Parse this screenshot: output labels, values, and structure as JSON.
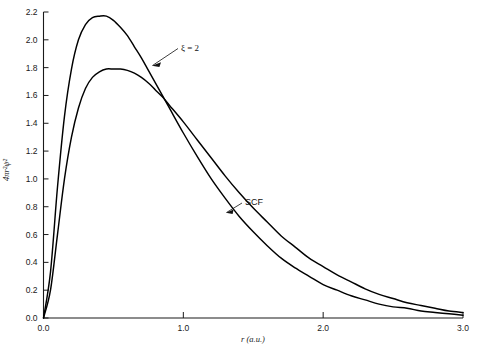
{
  "chart_data": {
    "type": "line",
    "title": "",
    "xlabel": "r (a.u.)",
    "ylabel": "4πr²ψ²",
    "xlim": [
      0.0,
      3.0
    ],
    "ylim": [
      0.0,
      2.2
    ],
    "grid": false,
    "legend_position": "inline-annotations",
    "xticks": [
      "0.0",
      "1.0",
      "2.0",
      "3.0"
    ],
    "xtick_values": [
      0.0,
      1.0,
      2.0,
      3.0
    ],
    "yticks": [
      "0.0",
      "0.2",
      "0.4",
      "0.6",
      "0.8",
      "1.0",
      "1.2",
      "1.4",
      "1.6",
      "1.8",
      "2.0",
      "2.2"
    ],
    "ytick_values": [
      0.0,
      0.2,
      0.4,
      0.6,
      0.8,
      1.0,
      1.2,
      1.4,
      1.6,
      1.8,
      2.0,
      2.2
    ],
    "series": [
      {
        "name": "ξ = 2",
        "color": "#000000",
        "peak_x": 0.47,
        "peak_y": 2.17,
        "x": [
          0.0,
          0.05,
          0.1,
          0.15,
          0.2,
          0.25,
          0.3,
          0.35,
          0.4,
          0.45,
          0.5,
          0.55,
          0.6,
          0.65,
          0.7,
          0.75,
          0.8,
          0.85,
          0.9,
          1.0,
          1.1,
          1.2,
          1.3,
          1.4,
          1.5,
          1.6,
          1.7,
          1.8,
          1.9,
          2.0,
          2.1,
          2.2,
          2.3,
          2.4,
          2.5,
          2.6,
          2.7,
          2.8,
          2.9,
          3.0
        ],
        "y": [
          0.0,
          0.33,
          0.94,
          1.45,
          1.79,
          2.0,
          2.11,
          2.16,
          2.17,
          2.17,
          2.14,
          2.09,
          2.03,
          1.95,
          1.87,
          1.78,
          1.69,
          1.6,
          1.51,
          1.33,
          1.16,
          1.0,
          0.86,
          0.73,
          0.62,
          0.52,
          0.43,
          0.36,
          0.3,
          0.24,
          0.2,
          0.16,
          0.13,
          0.1,
          0.08,
          0.07,
          0.05,
          0.04,
          0.03,
          0.02
        ]
      },
      {
        "name": "SCF",
        "color": "#000000",
        "peak_x": 0.57,
        "peak_y": 1.79,
        "x": [
          0.0,
          0.05,
          0.1,
          0.15,
          0.2,
          0.25,
          0.3,
          0.35,
          0.4,
          0.45,
          0.5,
          0.55,
          0.6,
          0.65,
          0.7,
          0.75,
          0.8,
          0.85,
          0.9,
          1.0,
          1.1,
          1.2,
          1.3,
          1.4,
          1.5,
          1.6,
          1.7,
          1.8,
          1.9,
          2.0,
          2.1,
          2.2,
          2.3,
          2.4,
          2.5,
          2.6,
          2.7,
          2.8,
          2.9,
          3.0
        ],
        "y": [
          0.0,
          0.2,
          0.6,
          1.0,
          1.3,
          1.51,
          1.65,
          1.73,
          1.77,
          1.79,
          1.79,
          1.79,
          1.78,
          1.76,
          1.73,
          1.69,
          1.64,
          1.59,
          1.53,
          1.41,
          1.28,
          1.15,
          1.02,
          0.9,
          0.79,
          0.69,
          0.59,
          0.51,
          0.43,
          0.37,
          0.31,
          0.26,
          0.21,
          0.17,
          0.14,
          0.11,
          0.09,
          0.07,
          0.05,
          0.04
        ]
      }
    ],
    "annotations": [
      {
        "text": "ξ = 2",
        "target_series": "ξ = 2"
      },
      {
        "text": "SCF",
        "target_series": "SCF"
      }
    ]
  }
}
